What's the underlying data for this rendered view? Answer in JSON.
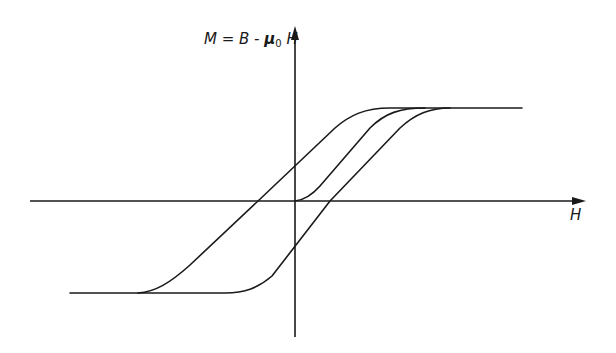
{
  "diagram": {
    "y_axis": {
      "label_prefix": "M = B - ",
      "label_mu": "μ",
      "label_sub": "0",
      "label_suffix": " H"
    },
    "x_axis": {
      "label": "H"
    },
    "curves": [
      {
        "name": "virgin-curve",
        "description": "Initial magnetization curve from origin to saturation"
      },
      {
        "name": "descending-branch",
        "description": "Upper branch from positive saturation to negative saturation"
      },
      {
        "name": "ascending-branch",
        "description": "Lower branch from negative saturation to positive saturation"
      }
    ],
    "colors": {
      "stroke": "#1a1a1a",
      "background": "#ffffff"
    }
  }
}
